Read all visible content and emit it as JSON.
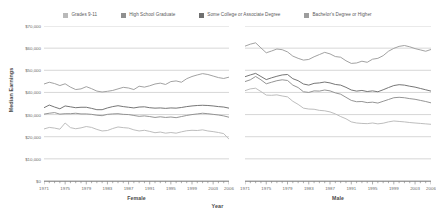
{
  "chart_data": {
    "type": "line",
    "title": "",
    "xlabel": "Year",
    "ylabel": "Median Earnings",
    "grid": true,
    "legend_position": "top",
    "ylim": [
      0,
      70000
    ],
    "xlim": [
      1971,
      2006
    ],
    "y_ticks": [
      {
        "value": 70000,
        "label": "$70,000"
      },
      {
        "value": 60000,
        "label": "$60,000"
      },
      {
        "value": 50000,
        "label": "$50,000"
      },
      {
        "value": 40000,
        "label": "$40,000"
      },
      {
        "value": 30000,
        "label": "$30,000"
      },
      {
        "value": 20000,
        "label": "$20,000"
      },
      {
        "value": 10000,
        "label": "$10,000"
      },
      {
        "value": 0,
        "label": "$0"
      }
    ],
    "x_ticks": [
      1971,
      1975,
      1979,
      1983,
      1987,
      1991,
      1995,
      1999,
      2003,
      2006
    ],
    "x_minor_step": 1,
    "legend": [
      {
        "label": "Grades 9-11",
        "color": "#b9b9b9"
      },
      {
        "label": "High School Graduate",
        "color": "#8f8f8f"
      },
      {
        "label": "Some College or Associate Degree",
        "color": "#6f6f6f"
      },
      {
        "label": "Bachelor's Degree or Higher",
        "color": "#9d9d9d"
      }
    ],
    "panels": [
      {
        "name": "Female",
        "x": [
          1971,
          1972,
          1973,
          1974,
          1975,
          1976,
          1977,
          1978,
          1979,
          1980,
          1981,
          1982,
          1983,
          1984,
          1985,
          1986,
          1987,
          1988,
          1989,
          1990,
          1991,
          1992,
          1993,
          1994,
          1995,
          1996,
          1997,
          1998,
          1999,
          2000,
          2001,
          2002,
          2003,
          2004,
          2005,
          2006
        ],
        "series": [
          {
            "name": "Grades 9-11",
            "color": "#b9b9b9",
            "values": [
              23500,
              24200,
              23900,
              23400,
              26200,
              24100,
              23600,
              24000,
              24600,
              24200,
              23300,
              22600,
              22800,
              23700,
              24400,
              24100,
              23900,
              23100,
              22600,
              22900,
              22400,
              21800,
              22100,
              21600,
              21900,
              21600,
              22200,
              22700,
              22900,
              22800,
              23100,
              22600,
              22300,
              21900,
              21400,
              18900
            ]
          },
          {
            "name": "High School Graduate",
            "color": "#8f8f8f",
            "values": [
              30200,
              30600,
              30900,
              30200,
              30400,
              30400,
              30600,
              30300,
              30300,
              30100,
              29700,
              29500,
              30100,
              30300,
              30400,
              30100,
              30000,
              29600,
              29200,
              29400,
              29100,
              28700,
              29000,
              28700,
              28900,
              28600,
              29100,
              29600,
              30000,
              30300,
              30600,
              30400,
              30100,
              29800,
              29400,
              28800
            ]
          },
          {
            "name": "Some College or Associate Degree",
            "color": "#6f6f6f",
            "values": [
              33100,
              34300,
              33400,
              32600,
              33900,
              33500,
              33100,
              33300,
              33300,
              32800,
              32200,
              32200,
              33000,
              33600,
              34000,
              33600,
              33300,
              33000,
              33400,
              33500,
              33100,
              32900,
              33000,
              32800,
              33000,
              32900,
              33200,
              33600,
              33900,
              34100,
              34200,
              34100,
              33900,
              33600,
              33400,
              32900
            ]
          },
          {
            "name": "Bachelor's Degree or Higher",
            "color": "#9d9d9d",
            "values": [
              43800,
              44600,
              44000,
              43100,
              43900,
              42400,
              41300,
              41600,
              42600,
              41700,
              40600,
              40200,
              40500,
              40900,
              41600,
              42300,
              42000,
              41300,
              42800,
              42400,
              43000,
              43800,
              44200,
              43600,
              44900,
              45200,
              44600,
              46200,
              47200,
              47900,
              48500,
              48100,
              47400,
              46700,
              46300,
              46900
            ]
          }
        ]
      },
      {
        "name": "Male",
        "x": [
          1971,
          1972,
          1973,
          1974,
          1975,
          1976,
          1977,
          1978,
          1979,
          1980,
          1981,
          1982,
          1983,
          1984,
          1985,
          1986,
          1987,
          1988,
          1989,
          1990,
          1991,
          1992,
          1993,
          1994,
          1995,
          1996,
          1997,
          1998,
          1999,
          2000,
          2001,
          2002,
          2003,
          2004,
          2005,
          2006
        ],
        "series": [
          {
            "name": "Grades 9-11",
            "color": "#b9b9b9",
            "values": [
              40800,
              41600,
              41900,
              40400,
              38800,
              38700,
              38900,
              38400,
              38000,
              36000,
              34600,
              32900,
              32500,
              32400,
              31900,
              31700,
              31200,
              30300,
              29100,
              28100,
              26700,
              26200,
              26000,
              25900,
              26200,
              25800,
              26100,
              26700,
              27100,
              26900,
              26700,
              26400,
              26200,
              26000,
              25800,
              25600
            ]
          },
          {
            "name": "High School Graduate",
            "color": "#8f8f8f",
            "values": [
              44900,
              45700,
              47200,
              45700,
              43900,
              44600,
              45300,
              45700,
              45400,
              43300,
              42200,
              40300,
              40000,
              40700,
              40600,
              41100,
              40700,
              39800,
              39200,
              37800,
              36400,
              35800,
              35900,
              35400,
              35600,
              35200,
              36000,
              36800,
              37600,
              37800,
              37600,
              37200,
              36900,
              36400,
              35900,
              35300
            ]
          },
          {
            "name": "Some College or Associate Degree",
            "color": "#6f6f6f",
            "values": [
              47100,
              47900,
              48600,
              47200,
              45800,
              46600,
              47300,
              47900,
              48100,
              46200,
              45300,
              43800,
              43300,
              44100,
              44300,
              44700,
              44300,
              43600,
              43300,
              42300,
              41100,
              40600,
              40900,
              40400,
              40700,
              40300,
              41200,
              42200,
              43100,
              43500,
              43300,
              42800,
              42400,
              41800,
              41200,
              40600
            ]
          },
          {
            "name": "Bachelor's Degree or Higher",
            "color": "#9d9d9d",
            "values": [
              60900,
              61800,
              62400,
              60100,
              57900,
              58700,
              59600,
              59300,
              58300,
              56400,
              55400,
              54600,
              54900,
              56100,
              57100,
              58100,
              57400,
              56200,
              55900,
              54300,
              53100,
              53300,
              54100,
              53600,
              55000,
              55400,
              56600,
              58600,
              59900,
              60800,
              61200,
              60600,
              59800,
              59200,
              58600,
              59400
            ]
          }
        ]
      }
    ]
  }
}
